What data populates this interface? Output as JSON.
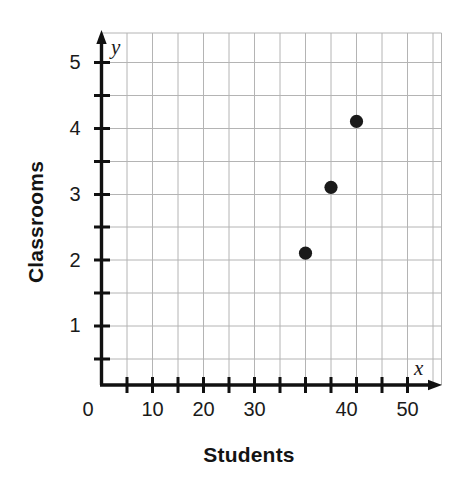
{
  "chart_data": {
    "type": "scatter",
    "title": "",
    "xlabel": "Students",
    "ylabel": "Classrooms",
    "x_var_label": "x",
    "y_var_label": "y",
    "points": [
      {
        "x": 40,
        "y": 2
      },
      {
        "x": 45,
        "y": 3
      },
      {
        "x": 50,
        "y": 4
      }
    ],
    "x_values": [
      40,
      45,
      50
    ],
    "y_values": [
      2,
      3,
      4
    ],
    "xlim": [
      0,
      55
    ],
    "ylim": [
      0,
      5.35
    ],
    "x_tick_step": 5,
    "y_tick_step": 0.5,
    "x_tick_labels": [
      "10",
      "20",
      "30",
      "40",
      "50"
    ],
    "x_tick_label_values": [
      10,
      20,
      30,
      40,
      50
    ],
    "y_tick_labels": [
      "1",
      "2",
      "3",
      "4",
      "5"
    ],
    "y_tick_label_values": [
      1,
      2,
      3,
      4,
      5
    ],
    "origin_label": "0",
    "grid": true,
    "legend": "none",
    "marker_color": "#1a1a1a",
    "grid_color": "#b4b4b4",
    "axis_color": "#111111"
  }
}
